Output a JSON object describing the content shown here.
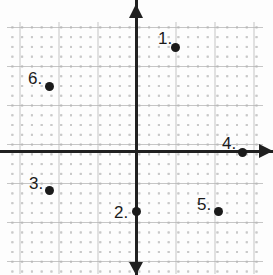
{
  "figure": {
    "type": "coordinate-plane",
    "width": 273,
    "height": 275,
    "background_color": "#fdfdfd",
    "axis_color": "#202020",
    "grid_dot_color": "#c9c9c9",
    "grid_major_color": "#b3b3b3",
    "point_color": "#1a1a1a",
    "origin_px": {
      "x": 136,
      "y": 152
    },
    "minor_cell_px": 9.77,
    "major_cell_px": 39.07,
    "axes": {
      "x_axis_name": "x-axis",
      "y_axis_name": "y-axis",
      "x_arrow_direction": "right",
      "y_arrow_direction": "up",
      "y_arrow_direction_secondary": "down",
      "tick_labels": []
    }
  },
  "chart_data": {
    "type": "scatter",
    "title": "",
    "xlabel": "",
    "ylabel": "",
    "grid": true,
    "legend": "none",
    "xlim": [
      -3.3,
      3.25
    ],
    "ylim": [
      -3.15,
      3.3
    ],
    "labels": [
      "1",
      "2",
      "3",
      "4",
      "5",
      "6"
    ],
    "points": [
      {
        "label": "1",
        "x": 1,
        "y": 2.7,
        "px": 175,
        "py": 47,
        "label_px": 158,
        "label_py": 30
      },
      {
        "label": "2",
        "x": 0,
        "y": -1.5,
        "px": 136,
        "py": 211,
        "label_px": 114,
        "label_py": 204
      },
      {
        "label": "3",
        "x": -2.2,
        "y": -1,
        "px": 49,
        "py": 190,
        "label_px": 29,
        "label_py": 175
      },
      {
        "label": "4",
        "x": 2.7,
        "y": 0,
        "px": 242,
        "py": 152,
        "label_px": 222,
        "label_py": 135
      },
      {
        "label": "5",
        "x": 2.1,
        "y": -1.5,
        "px": 218,
        "py": 211,
        "label_px": 197,
        "label_py": 196
      },
      {
        "label": "6",
        "x": -2.2,
        "y": 1.7,
        "px": 49,
        "py": 86,
        "label_px": 28,
        "label_py": 70
      }
    ]
  }
}
